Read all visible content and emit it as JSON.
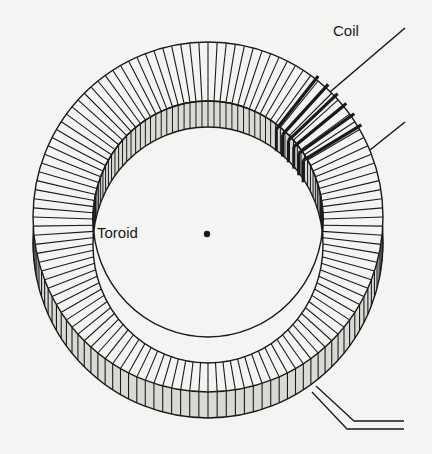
{
  "diagram": {
    "labels": {
      "coil": "Coil",
      "toroid": "Toroid"
    },
    "colors": {
      "background": "#f4f4f2",
      "line": "#1a1a1a",
      "side_fill": "#d9d9d6",
      "face_fill": "#f4f4f2"
    },
    "center_dot": {
      "x": 207,
      "y": 234
    },
    "radial_line_count": 120,
    "coil_turns": 6
  }
}
